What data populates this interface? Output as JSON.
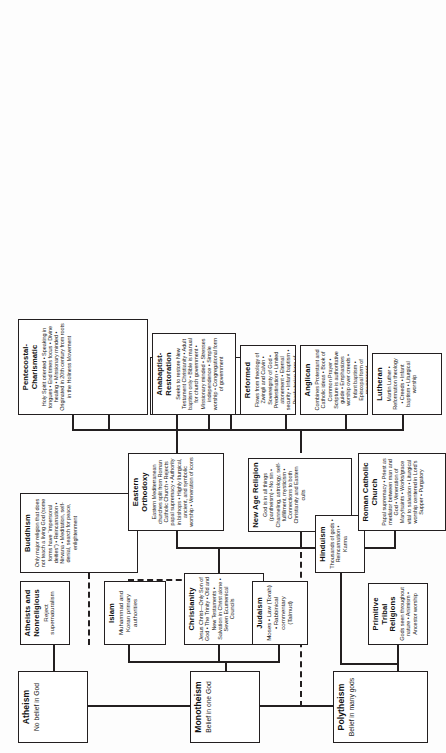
{
  "chart": {
    "orientation": "landscape-rotated-90ccw",
    "roots": {
      "polytheism": {
        "title": "Polytheism",
        "desc": "Belief in many gods"
      },
      "monotheism": {
        "title": "Monotheism",
        "desc": "Belief in one God"
      },
      "atheism": {
        "title": "Atheism",
        "desc": "No belief in God"
      }
    },
    "nodes": {
      "primitive_tribal": {
        "title": "Primitive Tribal Religions",
        "desc": "Gods seen throughout nature • Animism • Ancestor worship"
      },
      "hinduism": {
        "title": "Hinduism",
        "desc": "Thousands of gods • Reincarnation • Karma"
      },
      "new_age": {
        "title": "New Age Religion",
        "desc": "God is in all things (pantheism) • No sin • Channeling, astrology, self-fulfillment, mysticism • Connections to both Christianity and Eastern cults"
      },
      "judaism": {
        "title": "Judaism",
        "desc": "Moses • Law (Torah) • Rabbinical commentary (Talmud)"
      },
      "christianity": {
        "title": "Christianity",
        "desc": "Jesus Christ—Only Son of God • The Trinity • Old and New Testaments • Salvation in Christ alone • Seven Ecumenical Councils"
      },
      "islam": {
        "title": "Islam",
        "desc": "Muhammad and Koran primary authorities"
      },
      "buddhism": {
        "title": "Buddhism",
        "desc": "Only major religion that does not teach a living God (some forms have “impersonal deities”) • Reincarnation • Nirvana • Meditation, self-denial, search for peace, enlightenment"
      },
      "atheists_nonreligious": {
        "title": "Atheists and Nonreligious",
        "desc": "Reject supernaturalism"
      },
      "roman_catholic": {
        "title": "Roman Catholic Church",
        "desc": "Papal supremacy • Priest as mediator between man and God • Veneration of Mary/saints • Works/grace vital to salvation • Liturgical worship centered in Lord’s Supper • Purgatory"
      },
      "protestantism": {
        "title": "Protestantism",
        "desc": "Originated in 16th-century break with Roman Catholic church (Reformation) • Led by Luther, Zwingli, Calvin • Justification by grace through faith • Scripture is sole authority for faith and life • Priesthood of all believers"
      },
      "eastern_orthodox": {
        "title": "Eastern Orthodoxy",
        "desc": "Eastern Mediterranean churches split from Roman Catholic Church • Rejects papal supremacy • Authority in bishops • Highly liturgical, ancient, and symbolic worship • Veneration of icons"
      },
      "greek_orthodox": {
        "title": "Greek Orthodox",
        "desc": ""
      },
      "russian_orthodox": {
        "title": "Russian Orthodox",
        "desc": ""
      },
      "other_ethnic": {
        "title": "Other national/ ethnic churches",
        "desc": ""
      },
      "lutheran": {
        "title": "Lutheran",
        "desc": "Martin Luther • Reformation theology • Creeds • Infant baptism • Liturgical worship"
      },
      "anglican": {
        "title": "Anglican",
        "desc": "Combines Protestant and Catholic ideas • Book of Common Prayer • Scripture is authoritative guide • Emphasizes worship over creeds • Infant baptism • Episcopal form of government"
      },
      "reformed": {
        "title": "Reformed",
        "desc": "Flows from theology of Zwingli and Calvin • Sovereignty of God • Predestination • Limited atonement • Eternal security • Infant baptism • Presbyterian form of government"
      },
      "anabaptist": {
        "title": "Anabaptist-Restoration",
        "desc": "Seeks to restore New Testament Christianity • Adult baptism only • Bible is manual for church government • Missionary minded • Stresses independence • Simple worship • Congregational form of government"
      },
      "pentecostal": {
        "title": "Pentecostal-Charismatic",
        "desc": "Holy Spirit oriented • Speaking in tongues • End times focus • Divine healing • Missionary minded • Originated in 20th century from roots in the Holiness Movement"
      }
    }
  }
}
